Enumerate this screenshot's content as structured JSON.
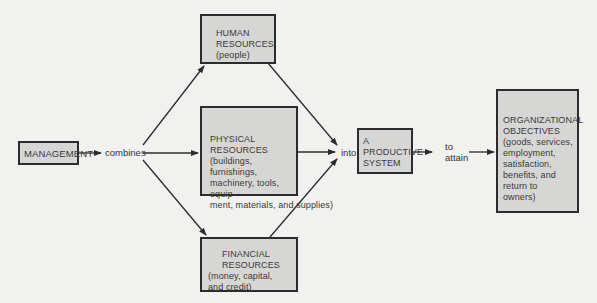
{
  "diagram": {
    "nodes": {
      "management": {
        "label": "MANAGEMENT"
      },
      "human": {
        "title": "HUMAN",
        "title2": "RESOURCES",
        "detail": "(people)"
      },
      "physical": {
        "title": "PHYSICAL RESOURCES",
        "lines": [
          "(buildings, furnishings,",
          "machinery, tools, equip-",
          "ment, materials, and supplies)"
        ]
      },
      "financial": {
        "title": "FINANCIAL RESOURCES",
        "lines": [
          "(money, capital,",
          "and credit)"
        ]
      },
      "productive": {
        "lines": [
          "A",
          "PRODUCTIVE",
          "SYSTEM"
        ]
      },
      "objectives": {
        "lines": [
          "ORGANIZATIONAL",
          "OBJECTIVES",
          "(goods, services,",
          "employment,",
          "satisfaction,",
          "benefits, and",
          "return to",
          "owners)"
        ]
      }
    },
    "edge_labels": {
      "combines": "combines",
      "into": "into",
      "to_attain_1": "to",
      "to_attain_2": "attain"
    },
    "colors": {
      "background": "#f1f1ef",
      "box_fill": "#d6d6d4",
      "border": "#2c2c2c",
      "text": "#3a3a3a"
    }
  }
}
